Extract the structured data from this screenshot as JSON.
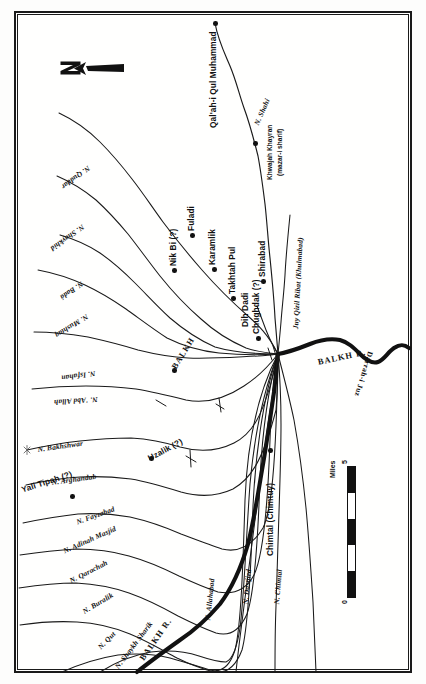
{
  "map": {
    "title": "Balkh oasis canal system",
    "orientation_note": "map rotated 90°; north points to the left of the image",
    "frame_color": "#1a1a1a",
    "background_color": "#fffffe",
    "north_arrow": {
      "label": "N",
      "icon": "north-arrow-icon",
      "points": "left"
    },
    "scale": {
      "unit_label": "Miles",
      "min_tick": "0",
      "max_tick": "5",
      "segments": 5
    },
    "rivers": [
      {
        "name": "BALKH R.",
        "id": "balkh-r-east"
      },
      {
        "name": "BALKH R.",
        "id": "balkh-r-south"
      },
      {
        "name": "Darrah-i Juz",
        "id": "darrah-i-juz"
      }
    ],
    "settlements": [
      {
        "name": "Qal'ah-i Qul Muhammad"
      },
      {
        "name": "Khwajah Khayran",
        "subtitle": "(mazar-i sharif)"
      },
      {
        "name": "Nik Bi (?)"
      },
      {
        "name": "Fuladi"
      },
      {
        "name": "Karamlik"
      },
      {
        "name": "Takhtah Pul"
      },
      {
        "name": "Dih Dadi"
      },
      {
        "name": "Shirabad"
      },
      {
        "name": "Chughdak (?)"
      },
      {
        "name": "BALKH"
      },
      {
        "name": "Uzalik (?)"
      },
      {
        "name": "Yali Tipah (?)"
      },
      {
        "name": "Chimtal (Chimtuy)"
      }
    ],
    "canals": [
      {
        "name": "N. Shahi"
      },
      {
        "name": "Juy Qizil Ribat (Khulmabad)"
      },
      {
        "name": "N. Quddar"
      },
      {
        "name": "N. Shaykhid"
      },
      {
        "name": "N. Badá"
      },
      {
        "name": "N. Mushtaq"
      },
      {
        "name": "N. Isfahan"
      },
      {
        "name": "N. 'Abd Allah"
      },
      {
        "name": "N. Bakhshwar"
      },
      {
        "name": "N. Arghandab"
      },
      {
        "name": "N. Fayzabad"
      },
      {
        "name": "N. Adinah Masjid"
      },
      {
        "name": "N. Qarachah"
      },
      {
        "name": "N. Buralik"
      },
      {
        "name": "N. Qut"
      },
      {
        "name": "N. Shaykh Sharik"
      },
      {
        "name": "N. Allahabad"
      },
      {
        "name": "N. Dastjird"
      },
      {
        "name": "N. Chimtal"
      }
    ]
  }
}
